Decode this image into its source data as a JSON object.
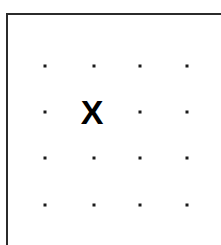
{
  "canvas": {
    "width": 221,
    "height": 245,
    "background_color": "#ffffff"
  },
  "frame": {
    "name": "panel-border",
    "border_color": "#2b2b2b",
    "border_width": 2,
    "left": 6,
    "top": 13,
    "width": 215,
    "height": 232,
    "visible_edges": "top-and-left"
  },
  "grid": {
    "label": "dot grid",
    "columns": 4,
    "rows": 4,
    "dot_color": "#1b1b1b",
    "dot_size": 3,
    "column_x": [
      45,
      94,
      140,
      187
    ],
    "row_y": [
      66,
      112,
      158,
      205
    ],
    "cells": [
      {
        "row": 1,
        "col": 1,
        "x": 45,
        "y": 66,
        "content": "dot"
      },
      {
        "row": 1,
        "col": 2,
        "x": 94,
        "y": 66,
        "content": "dot"
      },
      {
        "row": 1,
        "col": 3,
        "x": 140,
        "y": 66,
        "content": "dot"
      },
      {
        "row": 1,
        "col": 4,
        "x": 187,
        "y": 66,
        "content": "dot"
      },
      {
        "row": 2,
        "col": 1,
        "x": 45,
        "y": 112,
        "content": "dot"
      },
      {
        "row": 2,
        "col": 2,
        "x": 92,
        "y": 112,
        "content": "marker"
      },
      {
        "row": 2,
        "col": 3,
        "x": 140,
        "y": 112,
        "content": "dot"
      },
      {
        "row": 2,
        "col": 4,
        "x": 187,
        "y": 112,
        "content": "dot"
      },
      {
        "row": 3,
        "col": 1,
        "x": 45,
        "y": 158,
        "content": "dot"
      },
      {
        "row": 3,
        "col": 2,
        "x": 94,
        "y": 158,
        "content": "dot"
      },
      {
        "row": 3,
        "col": 3,
        "x": 140,
        "y": 158,
        "content": "dot"
      },
      {
        "row": 3,
        "col": 4,
        "x": 187,
        "y": 158,
        "content": "dot"
      },
      {
        "row": 4,
        "col": 1,
        "x": 45,
        "y": 205,
        "content": "dot"
      },
      {
        "row": 4,
        "col": 2,
        "x": 94,
        "y": 205,
        "content": "dot"
      },
      {
        "row": 4,
        "col": 3,
        "x": 140,
        "y": 205,
        "content": "dot"
      },
      {
        "row": 4,
        "col": 4,
        "x": 187,
        "y": 205,
        "content": "dot"
      }
    ]
  },
  "marker": {
    "name": "x-marker",
    "glyph": "X",
    "color": "#000000",
    "font_size": 34,
    "x": 92,
    "y": 112,
    "row": 2,
    "col": 2
  }
}
